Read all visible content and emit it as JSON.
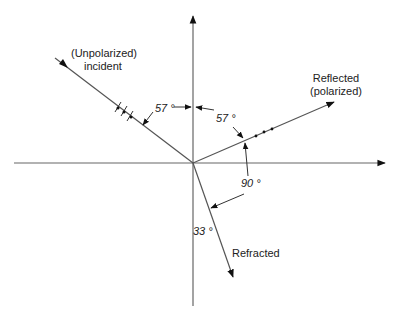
{
  "diagram": {
    "labels": {
      "incident_line1": "(Unpolarized)",
      "incident_line2": "incident",
      "reflected_line1": "Reflected",
      "reflected_line2": "(polarized)",
      "refracted": "Refracted"
    },
    "angles": {
      "incident": "57 °",
      "reflected": "57 °",
      "between_reflected_refracted": "90 °",
      "refracted": "33 °"
    },
    "colors": {
      "line": "#555555",
      "arrow": "#111111",
      "text": "#222222"
    }
  }
}
